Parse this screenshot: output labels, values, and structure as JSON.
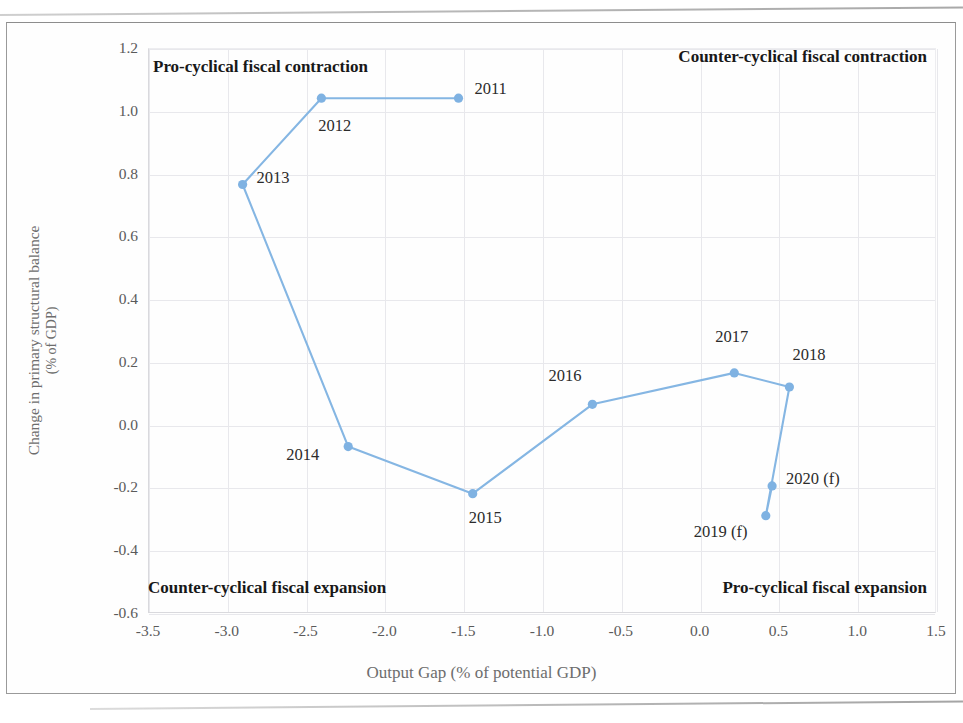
{
  "figure": {
    "accent_color": "#85b6e3",
    "marker_color": "#7fb2e2",
    "grid_color": "#e8e8ec"
  },
  "axes": {
    "x_title": "Output Gap (% of potential GDP)",
    "y_title_line1": "Change in primary structural balance",
    "y_title_line2": "(% of GDP)",
    "x_ticks": [
      "-3.5",
      "-3.0",
      "-2.5",
      "-2.0",
      "-1.5",
      "-1.0",
      "-0.5",
      "0.0",
      "0.5",
      "1.0",
      "1.5"
    ],
    "y_ticks": [
      "1.2",
      "1.0",
      "0.8",
      "0.6",
      "0.4",
      "0.2",
      "0.0",
      "-0.2",
      "-0.4",
      "-0.6"
    ]
  },
  "quadrants": {
    "top_left": "Pro-cyclical fiscal contraction",
    "top_right": "Counter-cyclical fiscal contraction",
    "bottom_left": "Counter-cyclical fiscal expansion",
    "bottom_right": "Pro-cyclical fiscal expansion"
  },
  "chart_data": {
    "type": "scatter",
    "title": "",
    "xlabel": "Output Gap (% of potential GDP)",
    "ylabel": "Change in primary structural balance (% of GDP)",
    "xlim": [
      -3.5,
      1.5
    ],
    "ylim": [
      -0.6,
      1.2
    ],
    "xticks": [
      -3.5,
      -3.0,
      -2.5,
      -2.0,
      -1.5,
      -1.0,
      -0.5,
      0.0,
      0.5,
      1.0,
      1.5
    ],
    "yticks": [
      -0.6,
      -0.4,
      -0.2,
      0.0,
      0.2,
      0.4,
      0.6,
      0.8,
      1.0,
      1.2
    ],
    "grid": true,
    "legend": "none",
    "connected": true,
    "points": [
      {
        "label": "2011",
        "x": -1.53,
        "y": 1.04,
        "label_dx": 16,
        "label_dy": -9
      },
      {
        "label": "2012",
        "x": -2.4,
        "y": 1.04,
        "label_dx": -3,
        "label_dy": 28
      },
      {
        "label": "2013",
        "x": -2.9,
        "y": 0.765,
        "label_dx": 14,
        "label_dy": -7
      },
      {
        "label": "2014",
        "x": -2.23,
        "y": -0.07,
        "label_dx": -62,
        "label_dy": 8
      },
      {
        "label": "2015",
        "x": -1.44,
        "y": -0.22,
        "label_dx": -4,
        "label_dy": 24
      },
      {
        "label": "2016",
        "x": -0.68,
        "y": 0.065,
        "label_dx": -44,
        "label_dy": -28
      },
      {
        "label": "2017",
        "x": 0.22,
        "y": 0.165,
        "label_dx": -19,
        "label_dy": -36
      },
      {
        "label": "2018",
        "x": 0.57,
        "y": 0.12,
        "label_dx": 3,
        "label_dy": -32
      },
      {
        "label": "2019 (f)",
        "x": 0.42,
        "y": -0.29,
        "label_dx": -72,
        "label_dy": 16
      },
      {
        "label": "2020 (f)",
        "x": 0.46,
        "y": -0.195,
        "label_dx": 14,
        "label_dy": -7
      }
    ]
  }
}
